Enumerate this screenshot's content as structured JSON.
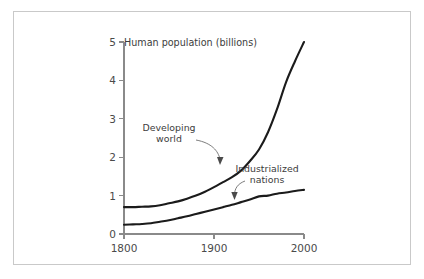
{
  "figure": {
    "title": "Human population (billions)",
    "border_color": "#c9c9c9",
    "background": "#ffffff"
  },
  "chart_data": {
    "type": "line",
    "title": "Human population (billions)",
    "xlabel": "",
    "ylabel": "Human population (billions)",
    "xlim": [
      1800,
      2000
    ],
    "ylim": [
      0,
      5
    ],
    "grid": false,
    "legend": "annotations-inline",
    "x_ticks": [
      "1800",
      "1900",
      "2000"
    ],
    "x_tick_values": [
      1800,
      1900,
      2000
    ],
    "y_ticks": [
      "0",
      "1",
      "2",
      "3",
      "4",
      "5"
    ],
    "y_tick_values": [
      0,
      1,
      2,
      3,
      4,
      5
    ],
    "x": [
      1800,
      1810,
      1820,
      1830,
      1840,
      1850,
      1860,
      1870,
      1880,
      1890,
      1900,
      1910,
      1920,
      1930,
      1940,
      1950,
      1960,
      1970,
      1980,
      1990,
      2000
    ],
    "series": [
      {
        "name": "Developing world",
        "color": "#1b1b1b",
        "values": [
          0.7,
          0.7,
          0.71,
          0.72,
          0.75,
          0.8,
          0.85,
          0.92,
          1.0,
          1.1,
          1.22,
          1.35,
          1.48,
          1.65,
          1.9,
          2.2,
          2.65,
          3.25,
          3.95,
          4.5,
          5.0
        ]
      },
      {
        "name": "Industrialized nations",
        "color": "#1b1b1b",
        "values": [
          0.24,
          0.25,
          0.26,
          0.28,
          0.32,
          0.36,
          0.41,
          0.46,
          0.52,
          0.58,
          0.64,
          0.7,
          0.76,
          0.83,
          0.9,
          0.98,
          1.0,
          1.05,
          1.08,
          1.12,
          1.15
        ]
      }
    ],
    "annotations": [
      {
        "label_line1": "Developing",
        "label_line2": "world",
        "target_x": 1938,
        "target_y": 2.0
      },
      {
        "label_line1": "Industrialized",
        "label_line2": "nations",
        "target_x": 1970,
        "target_y": 1.05
      }
    ]
  }
}
